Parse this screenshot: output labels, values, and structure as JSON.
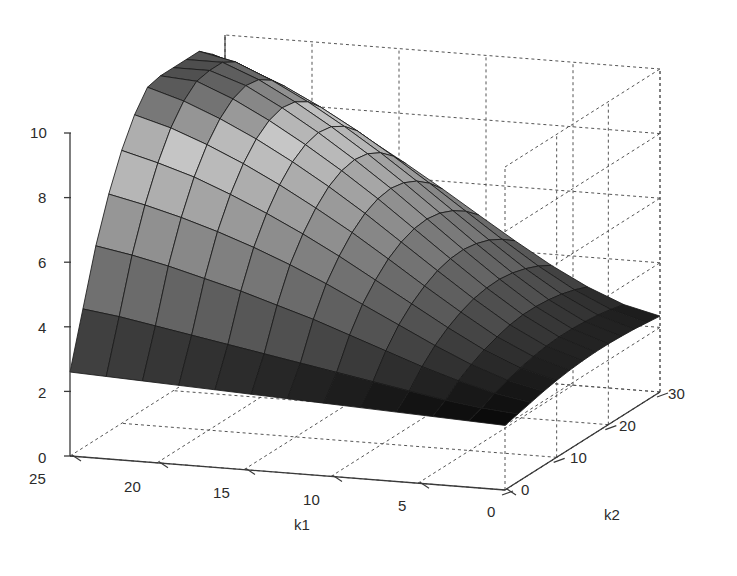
{
  "figure": {
    "background": "#ffffff",
    "width": 737,
    "height": 576,
    "line_color": "#3a3a3a",
    "grid_color": "#555555",
    "mesh_edge_color": "#1a1a1a"
  },
  "axes": {
    "z": {
      "label": "",
      "ticks": [
        "0",
        "2",
        "4",
        "6",
        "8",
        "10"
      ],
      "values": [
        0,
        2,
        4,
        6,
        8,
        10
      ],
      "range": [
        0,
        10
      ]
    },
    "k1": {
      "label": "k1",
      "ticks": [
        "25",
        "20",
        "15",
        "10",
        "5",
        "0"
      ],
      "values": [
        25,
        20,
        15,
        10,
        5,
        0
      ],
      "range": [
        0,
        25
      ],
      "direction": "descending-left-to-right"
    },
    "k2": {
      "label": "k2",
      "ticks": [
        "0",
        "10",
        "20",
        "30"
      ],
      "values": [
        0,
        10,
        20,
        30
      ],
      "range": [
        0,
        30
      ],
      "direction": "ascending-front-to-back"
    }
  },
  "chart_data": {
    "type": "surface",
    "title": "",
    "xlabel": "k1",
    "ylabel": "k2",
    "zlabel": "",
    "xlim": [
      0,
      25
    ],
    "ylim": [
      0,
      30
    ],
    "zlim": [
      0,
      10
    ],
    "grid": true,
    "legend": null,
    "colormap": "gray",
    "projection": "3d-matlab-default",
    "view_azimuth": -37.5,
    "view_elevation": 30,
    "x": [
      0,
      2.0833,
      4.1667,
      6.25,
      8.3333,
      10.4167,
      12.5,
      14.5833,
      16.6667,
      18.75,
      20.8333,
      22.9167,
      25
    ],
    "y": [
      0,
      2.5,
      5,
      7.5,
      10,
      12.5,
      15,
      17.5,
      20,
      22.5,
      25,
      27.5,
      30
    ],
    "z": [
      [
        2.0,
        2.05,
        2.1,
        2.15,
        2.2,
        2.25,
        2.3,
        2.35,
        2.4,
        2.45,
        2.5,
        2.55,
        2.6
      ],
      [
        2.1,
        2.2,
        2.35,
        2.55,
        2.75,
        2.95,
        3.15,
        3.35,
        3.55,
        3.75,
        3.95,
        4.15,
        4.3
      ],
      [
        2.2,
        2.4,
        2.7,
        3.05,
        3.45,
        3.85,
        4.25,
        4.6,
        4.95,
        5.25,
        5.55,
        5.8,
        6.0
      ],
      [
        2.3,
        2.55,
        2.95,
        3.45,
        4.0,
        4.55,
        5.1,
        5.6,
        6.05,
        6.45,
        6.8,
        7.1,
        7.35
      ],
      [
        2.38,
        2.68,
        3.15,
        3.75,
        4.4,
        5.05,
        5.7,
        6.3,
        6.85,
        7.35,
        7.8,
        8.15,
        8.45
      ],
      [
        2.44,
        2.78,
        3.3,
        3.98,
        4.7,
        5.45,
        6.18,
        6.85,
        7.48,
        8.05,
        8.55,
        8.98,
        9.3
      ],
      [
        2.48,
        2.85,
        3.42,
        4.14,
        4.92,
        5.72,
        6.52,
        7.26,
        7.94,
        8.56,
        9.1,
        9.56,
        9.9
      ],
      [
        2.5,
        2.88,
        3.48,
        4.22,
        5.04,
        5.88,
        6.72,
        7.5,
        8.22,
        8.88,
        9.46,
        9.92,
        10.0
      ],
      [
        2.5,
        2.88,
        3.48,
        4.24,
        5.07,
        5.93,
        6.79,
        7.59,
        8.34,
        9.02,
        9.62,
        10.0,
        10.0
      ],
      [
        2.48,
        2.85,
        3.44,
        4.18,
        5.0,
        5.86,
        6.71,
        7.52,
        8.27,
        8.95,
        9.55,
        10.0,
        10.0
      ],
      [
        2.45,
        2.8,
        3.36,
        4.06,
        4.86,
        5.68,
        6.51,
        7.3,
        8.03,
        8.7,
        9.28,
        9.76,
        10.0
      ],
      [
        2.4,
        2.72,
        3.24,
        3.89,
        4.63,
        5.41,
        6.19,
        6.94,
        7.64,
        8.28,
        8.84,
        9.3,
        9.66
      ],
      [
        2.35,
        2.62,
        3.08,
        3.66,
        4.33,
        5.04,
        5.76,
        6.45,
        7.1,
        7.7,
        8.22,
        8.66,
        9.0
      ]
    ]
  },
  "tick_positions": {
    "z": [
      {
        "label": "10",
        "x": 30,
        "y": 124
      },
      {
        "label": "8",
        "x": 38,
        "y": 189
      },
      {
        "label": "6",
        "x": 38,
        "y": 254
      },
      {
        "label": "4",
        "x": 38,
        "y": 319
      },
      {
        "label": "2",
        "x": 38,
        "y": 384
      },
      {
        "label": "0",
        "x": 38,
        "y": 449
      }
    ],
    "k1": [
      {
        "label": "25",
        "x": 29,
        "y": 470
      },
      {
        "label": "20",
        "x": 124,
        "y": 478
      },
      {
        "label": "15",
        "x": 213,
        "y": 484
      },
      {
        "label": "10",
        "x": 303,
        "y": 491
      },
      {
        "label": "5",
        "x": 398,
        "y": 497
      },
      {
        "label": "0",
        "x": 487,
        "y": 503
      }
    ],
    "k2": [
      {
        "label": "0",
        "x": 521,
        "y": 481
      },
      {
        "label": "10",
        "x": 570,
        "y": 449
      },
      {
        "label": "20",
        "x": 619,
        "y": 417
      },
      {
        "label": "30",
        "x": 668,
        "y": 385
      }
    ],
    "axis_labels": [
      {
        "label": "k1",
        "x": 294,
        "y": 516
      },
      {
        "label": "k2",
        "x": 604,
        "y": 506
      }
    ]
  }
}
